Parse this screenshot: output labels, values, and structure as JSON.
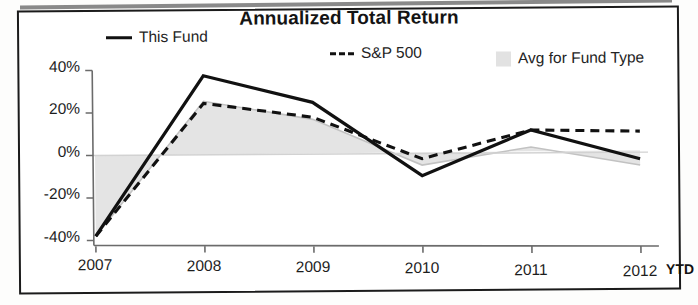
{
  "chart_data": {
    "type": "line",
    "title": "Annualized Total Return",
    "xlabel": "",
    "ylabel": "",
    "ylim": [
      -40,
      40
    ],
    "yticks": [
      40,
      20,
      0,
      -20,
      -40
    ],
    "ytick_labels": [
      "40%",
      "20%",
      "0%",
      "-20%",
      "-40%"
    ],
    "categories": [
      "2007",
      "2008",
      "2009",
      "2010",
      "2011",
      "2012"
    ],
    "x_suffix_label": "YTD",
    "grid": false,
    "legend_position": "top",
    "series": [
      {
        "name": "This Fund",
        "style": "solid",
        "color": "#111111",
        "values": [
          -38,
          37,
          24,
          -11,
          10,
          -4
        ]
      },
      {
        "name": "S&P 500",
        "style": "dashed",
        "color": "#111111",
        "values": [
          -38,
          24,
          17,
          -3,
          10,
          9
        ]
      },
      {
        "name": "Avg for Fund Type",
        "style": "area",
        "color": "#e2e2e2",
        "values": [
          -38,
          25,
          16,
          -6,
          2,
          -7
        ]
      }
    ]
  },
  "chart": {
    "title": "Annualized Total Return",
    "legend": [
      {
        "label": "This Fund",
        "marker": "solid-line-icon"
      },
      {
        "label": "S&P 500",
        "marker": "dashed-line-icon"
      },
      {
        "label": "Avg for Fund Type",
        "marker": "area-swatch-icon"
      }
    ],
    "y_axis": {
      "ticks": [
        "40%",
        "20%",
        "0%",
        "-20%",
        "-40%"
      ]
    },
    "x_axis": {
      "ticks": [
        "2007",
        "2008",
        "2009",
        "2010",
        "2011",
        "2012"
      ],
      "suffix": "YTD"
    },
    "colors": {
      "line": "#111111",
      "area_fill": "#e2e2e2",
      "area_line": "#bdbdbd",
      "axis": "#6f6f6f",
      "frame": "#1b1b1b"
    }
  }
}
